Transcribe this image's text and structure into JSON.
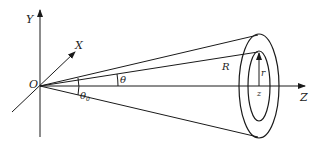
{
  "diagram": {
    "type": "cone-annulus-geometry",
    "colors": {
      "stroke": "#1a1a1a",
      "background": "#ffffff"
    },
    "labels": {
      "y_axis": "Y",
      "x_axis": "X",
      "z_axis": "Z",
      "origin": "O",
      "theta": "θ",
      "theta0_base": "θ",
      "theta0_sub": "0",
      "radius_R": "R",
      "radius_r": "r",
      "z_point": "z"
    }
  }
}
